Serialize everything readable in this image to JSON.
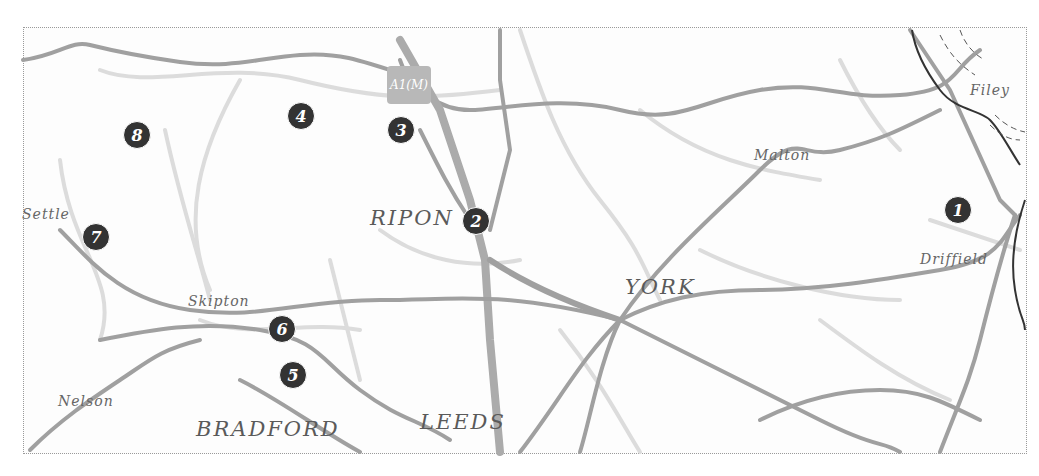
{
  "map": {
    "road_shield": "A1(M)",
    "towns": [
      {
        "name": "RIPON",
        "size": "big",
        "x": 370,
        "y": 206
      },
      {
        "name": "YORK",
        "size": "big",
        "x": 625,
        "y": 275
      },
      {
        "name": "LEEDS",
        "size": "big",
        "x": 420,
        "y": 410
      },
      {
        "name": "BRADFORD",
        "size": "big",
        "x": 196,
        "y": 417
      },
      {
        "name": "Settle",
        "size": "small",
        "x": 22,
        "y": 206
      },
      {
        "name": "Skipton",
        "size": "small",
        "x": 188,
        "y": 293
      },
      {
        "name": "Nelson",
        "size": "small",
        "x": 58,
        "y": 393
      },
      {
        "name": "Malton",
        "size": "small",
        "x": 754,
        "y": 147
      },
      {
        "name": "Filey",
        "size": "small",
        "x": 970,
        "y": 82
      },
      {
        "name": "Driffield",
        "size": "small",
        "x": 920,
        "y": 251
      }
    ],
    "markers": [
      {
        "label": "1",
        "x": 958,
        "y": 210
      },
      {
        "label": "2",
        "x": 476,
        "y": 221
      },
      {
        "label": "3",
        "x": 401,
        "y": 130
      },
      {
        "label": "4",
        "x": 301,
        "y": 116
      },
      {
        "label": "5",
        "x": 293,
        "y": 375
      },
      {
        "label": "6",
        "x": 282,
        "y": 329
      },
      {
        "label": "7",
        "x": 96,
        "y": 237
      },
      {
        "label": "8",
        "x": 137,
        "y": 135
      }
    ],
    "colors": {
      "major_road": "#a0a0a0",
      "minor_road": "#dcdcdc",
      "coastline": "#333333",
      "marker": "#333333"
    }
  }
}
